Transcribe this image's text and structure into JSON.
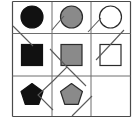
{
  "figure": {
    "kind": "matrix-reasoning-puzzle",
    "canvas": {
      "width": 138,
      "height": 126,
      "background": "#ffffff"
    },
    "grid": {
      "rows": 3,
      "cols": 3,
      "left": 12.5,
      "top": 1.5,
      "right": 130.5,
      "bottom": 116.5,
      "col_edges": [
        12.5,
        52.0,
        91.0,
        130.5
      ],
      "row_edges": [
        1.5,
        33.5,
        76.0,
        116.5
      ],
      "line_color": "#6e6e6e",
      "line_width": 1.0,
      "border_color": "#4a4a4a",
      "border_width": 1.2
    },
    "palette": {
      "black": "#111111",
      "gray": "#8a8a8a",
      "white": "#ffffff",
      "outline": "#2b2b2b",
      "overlay_line": "#5a5a5a"
    },
    "cells": [
      {
        "row": 0,
        "col": 0,
        "name": "cell-r1c1",
        "shape": "circle",
        "fill_name": "black",
        "fill": "#111111",
        "stroke": "#111111",
        "empty": false,
        "cx": 32.0,
        "cy": 17.0,
        "size": 22.0
      },
      {
        "row": 0,
        "col": 1,
        "name": "cell-r1c2",
        "shape": "circle",
        "fill_name": "gray",
        "fill": "#8a8a8a",
        "stroke": "#2b2b2b",
        "empty": false,
        "cx": 71.5,
        "cy": 17.0,
        "size": 22.0
      },
      {
        "row": 0,
        "col": 2,
        "name": "cell-r1c3",
        "shape": "circle",
        "fill_name": "white",
        "fill": "#ffffff",
        "stroke": "#2b2b2b",
        "empty": false,
        "cx": 110.5,
        "cy": 17.0,
        "size": 22.0
      },
      {
        "row": 1,
        "col": 0,
        "name": "cell-r2c1",
        "shape": "square",
        "fill_name": "black",
        "fill": "#111111",
        "stroke": "#111111",
        "empty": false,
        "cx": 32.0,
        "cy": 55.0,
        "size": 21.0
      },
      {
        "row": 1,
        "col": 1,
        "name": "cell-r2c2",
        "shape": "square",
        "fill_name": "gray",
        "fill": "#8a8a8a",
        "stroke": "#2b2b2b",
        "empty": false,
        "cx": 71.5,
        "cy": 55.0,
        "size": 21.0
      },
      {
        "row": 1,
        "col": 2,
        "name": "cell-r2c3",
        "shape": "square",
        "fill_name": "white",
        "fill": "#ffffff",
        "stroke": "#2b2b2b",
        "empty": false,
        "cx": 110.5,
        "cy": 55.0,
        "size": 21.0
      },
      {
        "row": 2,
        "col": 0,
        "name": "cell-r3c1",
        "shape": "pentagon",
        "fill_name": "black",
        "fill": "#111111",
        "stroke": "#111111",
        "empty": false,
        "cx": 32.0,
        "cy": 95.0,
        "size": 23.0
      },
      {
        "row": 2,
        "col": 1,
        "name": "cell-r3c2",
        "shape": "pentagon",
        "fill_name": "gray",
        "fill": "#8a8a8a",
        "stroke": "#2b2b2b",
        "empty": false,
        "cx": 71.5,
        "cy": 95.0,
        "size": 23.0
      },
      {
        "row": 2,
        "col": 2,
        "name": "cell-r3c3-empty",
        "shape": "none",
        "fill_name": "none",
        "fill": "none",
        "stroke": "none",
        "empty": true,
        "cx": 110.5,
        "cy": 95.0,
        "size": 0
      }
    ],
    "overlay_polyline": {
      "name": "zigzag-overlay",
      "stroke": "#5a5a5a",
      "stroke_width": 1.1,
      "points": "13,26 33,46 52,30 66,16 84,35 101,54 96,60 122,27 130,16"
    },
    "overlay_segments": [
      {
        "name": "overlay-seg-1",
        "points": "13,26 33,46"
      },
      {
        "name": "overlay-seg-2",
        "points": "52,30 64,16"
      },
      {
        "name": "overlay-seg-3",
        "points": "88,32 101,18"
      },
      {
        "name": "overlay-seg-4",
        "points": "96,60 124,30"
      },
      {
        "name": "overlay-seg-5",
        "points": "50,49 67,67 53,81 38,95 53,110"
      },
      {
        "name": "overlay-seg-6",
        "points": "67,67 86,86"
      },
      {
        "name": "overlay-seg-7",
        "points": "72,116 92,96"
      }
    ]
  }
}
